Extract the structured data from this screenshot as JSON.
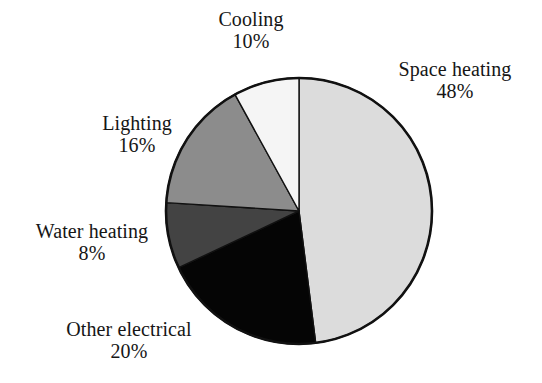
{
  "chart_data": {
    "type": "pie",
    "title": "",
    "subtitle": "",
    "xlabel": "",
    "ylabel": "",
    "legend_position": "none",
    "grid": false,
    "start_angle_deg": 0,
    "direction": "clockwise",
    "categories": [
      "Space heating",
      "Other electrical",
      "Water heating",
      "Lighting",
      "Cooling"
    ],
    "values": [
      48,
      20,
      8,
      16,
      10
    ],
    "value_unit": "%",
    "slices": [
      {
        "name": "Space heating",
        "value": 48,
        "value_label": "48%",
        "color": "#dcdcdc",
        "start_deg": 0,
        "end_deg": 172.8,
        "label_position": "right"
      },
      {
        "name": "Other electrical",
        "value": 20,
        "value_label": "20%",
        "color": "#050505",
        "start_deg": 172.8,
        "end_deg": 244.8,
        "label_position": "bottom-left"
      },
      {
        "name": "Water heating",
        "value": 8,
        "value_label": "8%",
        "color": "#434343",
        "start_deg": 244.8,
        "end_deg": 273.6,
        "label_position": "left"
      },
      {
        "name": "Lighting",
        "value": 16,
        "value_label": "16%",
        "color": "#8c8c8c",
        "start_deg": 273.6,
        "end_deg": 331.2,
        "label_position": "upper-left"
      },
      {
        "name": "Cooling",
        "value": 10,
        "value_label": "10%",
        "color": "#f5f5f5",
        "start_deg": 331.2,
        "end_deg": 360,
        "label_position": "top"
      }
    ],
    "outline_color": "#111111",
    "background_color": "#ffffff"
  },
  "labels": {
    "cooling": {
      "name": "Cooling",
      "value": "10%"
    },
    "space_heating": {
      "name": "Space heating",
      "value": "48%"
    },
    "lighting": {
      "name": "Lighting",
      "value": "16%"
    },
    "water_heating": {
      "name": "Water heating",
      "value": "8%"
    },
    "other_electric": {
      "name": "Other electrical",
      "value": "20%"
    }
  }
}
